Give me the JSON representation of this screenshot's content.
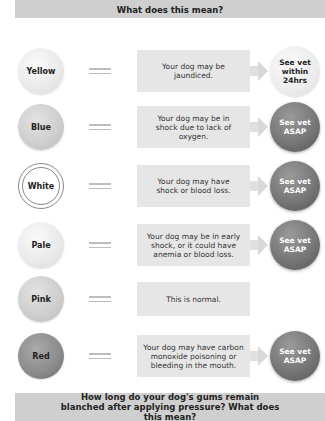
{
  "header": {
    "title": "What does this mean?"
  },
  "rows": [
    {
      "color": "Yellow",
      "description": "Your dog may be jaundiced.",
      "action": "See vet within 24hrs",
      "urgency": "soon"
    },
    {
      "color": "Blue",
      "description": "Your dog may be in shock due to lack of oxygen.",
      "action": "See vet ASAP",
      "urgency": "urgent"
    },
    {
      "color": "White",
      "description": "Your dog may have shock or blood loss.",
      "action": "See vet ASAP",
      "urgency": "urgent"
    },
    {
      "color": "Pale",
      "description": "Your dog may be in early shock, or it could have anemia or blood loss.",
      "action": "See vet ASAP",
      "urgency": "urgent"
    },
    {
      "color": "Pink",
      "description": "This is normal.",
      "action": null,
      "urgency": "none"
    },
    {
      "color": "Red",
      "description": "Your dog may have carbon monoxide poisoning or bleeding in the mouth.",
      "action": "See vet ASAP",
      "urgency": "urgent"
    }
  ],
  "footer": {
    "question": "How long do your dog's gums remain blanched after applying pressure? What does this mean?"
  },
  "colors": {
    "banner": "#cfcfcf",
    "desc_box": "#e6e6e6",
    "urgent": "#777777",
    "text": "#222222"
  }
}
